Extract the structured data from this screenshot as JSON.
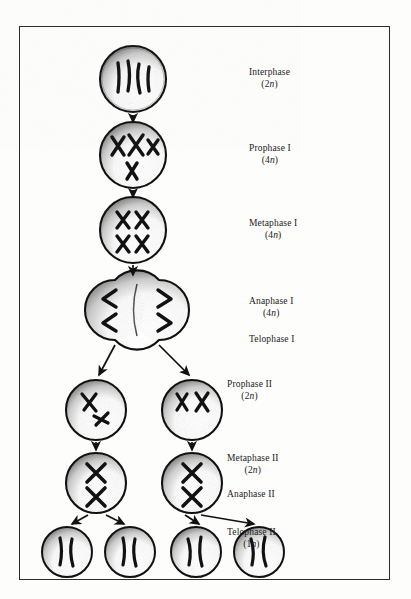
{
  "figure": {
    "border_color": "#2b2b2b",
    "background": "#fdfdfc",
    "ink_color": "#111111"
  },
  "stages": [
    {
      "id": "interphase",
      "name": "Interphase",
      "ploidy": "(2n)",
      "label_x": 248,
      "label_y": 44,
      "cx": 113,
      "cy": 52,
      "r": 33
    },
    {
      "id": "prophase-1",
      "name": "Prophase I",
      "ploidy": "(4n)",
      "label_x": 248,
      "label_y": 119,
      "cx": 113,
      "cy": 128,
      "r": 33
    },
    {
      "id": "metaphase-1",
      "name": "Metaphase I",
      "ploidy": "(4n)",
      "label_x": 248,
      "label_y": 194,
      "cx": 113,
      "cy": 203,
      "r": 33
    },
    {
      "id": "anaphase-1",
      "name": "Anaphase I",
      "ploidy": "(4n)",
      "label_x": 248,
      "label_y": 272,
      "cx": 113,
      "cy": 283,
      "r": 33
    },
    {
      "id": "telophase-1",
      "name": "Telophase I",
      "ploidy": "",
      "label_x": 248,
      "label_y": 310,
      "cx": 0,
      "cy": 0,
      "r": 0
    },
    {
      "id": "prophase-2",
      "name": "Prophase II",
      "ploidy": "(2n)",
      "label_x": 281,
      "label_y": 355,
      "cx": 0,
      "cy": 0,
      "r": 0
    },
    {
      "id": "metaphase-2",
      "name": "Metaphase II",
      "ploidy": "(2n)",
      "label_x": 281,
      "label_y": 429,
      "cx": 0,
      "cy": 0,
      "r": 0
    },
    {
      "id": "anaphase-2",
      "name": "Anaphase II",
      "ploidy": "",
      "label_x": 281,
      "label_y": 465,
      "cx": 0,
      "cy": 0,
      "r": 0
    },
    {
      "id": "telophase-2",
      "name": "Telophase II",
      "ploidy": "(1n)",
      "label_x": 281,
      "label_y": 503,
      "cx": 0,
      "cy": 0,
      "r": 0
    }
  ],
  "cells": {
    "interphase": {
      "cx": 113,
      "cy": 52,
      "r": 33,
      "chromosome_count": 4,
      "form": "thin-threads"
    },
    "prophase_1": {
      "cx": 113,
      "cy": 128,
      "r": 33,
      "chromosome_count": 4,
      "form": "paired-X"
    },
    "metaphase_1": {
      "cx": 113,
      "cy": 203,
      "r": 33,
      "chromosome_count": 4,
      "form": "aligned-X"
    },
    "anaphase_1_left": {
      "cx": 95,
      "cy": 283,
      "r": 30,
      "chromosome_count": 2,
      "form": "chevron-left"
    },
    "anaphase_1_right": {
      "cx": 139,
      "cy": 283,
      "r": 30,
      "chromosome_count": 2,
      "form": "chevron-right"
    },
    "prophase_2_left": {
      "cx": 76,
      "cy": 383,
      "r": 30,
      "chromosome_count": 2,
      "form": "irregular-X"
    },
    "prophase_2_right": {
      "cx": 172,
      "cy": 383,
      "r": 30,
      "chromosome_count": 2,
      "form": "irregular-X"
    },
    "metaphase_2_left": {
      "cx": 76,
      "cy": 456,
      "r": 30,
      "chromosome_count": 2,
      "form": "stacked-X"
    },
    "metaphase_2_right": {
      "cx": 172,
      "cy": 456,
      "r": 30,
      "chromosome_count": 2,
      "form": "stacked-X"
    },
    "telophase_2_a": {
      "cx": 47,
      "cy": 525,
      "r": 25,
      "chromosome_count": 2,
      "form": "single-threads"
    },
    "telophase_2_b": {
      "cx": 110,
      "cy": 525,
      "r": 25,
      "chromosome_count": 2,
      "form": "single-threads"
    },
    "telophase_2_c": {
      "cx": 176,
      "cy": 525,
      "r": 25,
      "chromosome_count": 2,
      "form": "single-threads"
    },
    "telophase_2_d": {
      "cx": 239,
      "cy": 525,
      "r": 25,
      "chromosome_count": 2,
      "form": "single-threads"
    }
  },
  "arrows": [
    {
      "id": "interphase-to-prophase1",
      "x1": 113,
      "y1": 88,
      "x2": 113,
      "y2": 95
    },
    {
      "id": "prophase1-to-metaphase1",
      "x1": 113,
      "y1": 163,
      "x2": 113,
      "y2": 170
    },
    {
      "id": "metaphase1-to-anaphase1",
      "x1": 113,
      "y1": 238,
      "x2": 113,
      "y2": 248
    },
    {
      "id": "anaphase1-to-prophase2-left",
      "x1": 95,
      "y1": 318,
      "x2": 78,
      "y2": 350
    },
    {
      "id": "anaphase1-to-prophase2-right",
      "x1": 139,
      "y1": 318,
      "x2": 170,
      "y2": 350
    },
    {
      "id": "prophase2-to-metaphase2-left",
      "x1": 76,
      "y1": 415,
      "x2": 76,
      "y2": 424
    },
    {
      "id": "prophase2-to-metaphase2-right",
      "x1": 172,
      "y1": 415,
      "x2": 172,
      "y2": 424
    },
    {
      "id": "metaphase2-left-to-telophase-a",
      "x1": 68,
      "y1": 488,
      "x2": 50,
      "y2": 498
    },
    {
      "id": "metaphase2-left-to-telophase-b",
      "x1": 86,
      "y1": 488,
      "x2": 106,
      "y2": 498
    },
    {
      "id": "metaphase2-right-to-telophase-c",
      "x1": 164,
      "y1": 488,
      "x2": 179,
      "y2": 498
    },
    {
      "id": "metaphase2-right-to-telophase-d",
      "x1": 182,
      "y1": 488,
      "x2": 236,
      "y2": 498
    }
  ]
}
